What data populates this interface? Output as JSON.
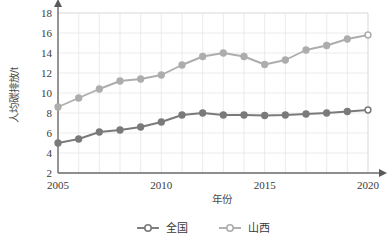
{
  "chart_data": {
    "type": "line",
    "title": "",
    "xlabel": "年份",
    "ylabel": "人均碳排放/t",
    "x": [
      2005,
      2006,
      2007,
      2008,
      2009,
      2010,
      2011,
      2012,
      2013,
      2014,
      2015,
      2016,
      2017,
      2018,
      2019,
      2020
    ],
    "xlim": [
      2005,
      2020
    ],
    "ylim": [
      2,
      18
    ],
    "xticks": [
      2005,
      2010,
      2015,
      2020
    ],
    "xtick_labels": [
      "2005",
      "2010",
      "2015",
      "2020"
    ],
    "yticks": [
      2,
      4,
      6,
      8,
      10,
      12,
      14,
      16,
      18
    ],
    "ytick_labels": [
      "2",
      "4",
      "6",
      "8",
      "10",
      "12",
      "14",
      "16",
      "18"
    ],
    "grid": true,
    "legend_position": "bottom",
    "series": [
      {
        "name": "全国",
        "color": "#7a7a7a",
        "marker": "circle",
        "values": [
          5.0,
          5.4,
          6.1,
          6.3,
          6.6,
          7.1,
          7.8,
          8.0,
          7.8,
          7.8,
          7.75,
          7.8,
          7.9,
          8.0,
          8.15,
          8.3
        ]
      },
      {
        "name": "山西",
        "color": "#adadad",
        "marker": "circle",
        "values": [
          8.6,
          9.5,
          10.4,
          11.2,
          11.4,
          11.8,
          12.8,
          13.65,
          14.0,
          13.65,
          12.85,
          13.3,
          14.3,
          14.75,
          15.4,
          15.8
        ]
      }
    ]
  },
  "legend": {
    "items": [
      {
        "label": "全国",
        "color": "#7a7a7a"
      },
      {
        "label": "山西",
        "color": "#adadad"
      }
    ]
  },
  "colors": {
    "national": "#7a7a7a",
    "shanxi": "#adadad",
    "axis": "#6b6b6b",
    "grid": "#e3e3e3",
    "text": "#3a3a3a",
    "background": "#ffffff"
  }
}
